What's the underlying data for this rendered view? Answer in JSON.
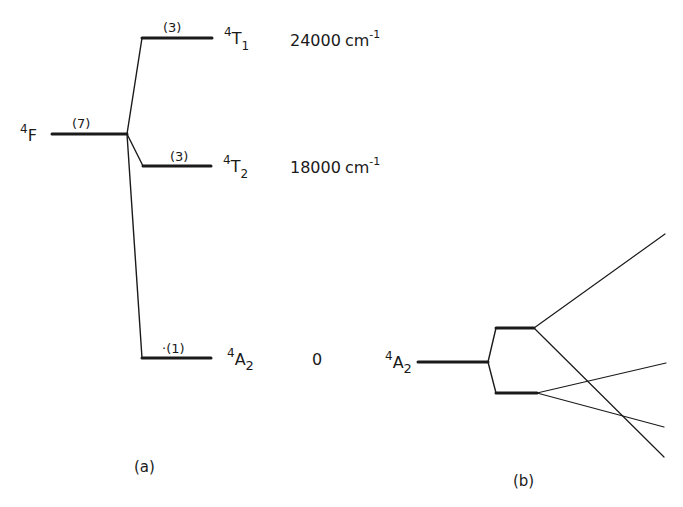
{
  "panel_a": {
    "caption": "(a)",
    "free_ion": {
      "sup": "4",
      "term": "F",
      "degeneracy": "(7)"
    },
    "levels": [
      {
        "sup": "4",
        "term": "T",
        "sub": "1",
        "degeneracy": "(3)",
        "energy": "24000",
        "unit": "cm",
        "unit_exp": "-1"
      },
      {
        "sup": "4",
        "term": "T",
        "sub": "2",
        "degeneracy": "(3)",
        "energy": "18000",
        "unit": "cm",
        "unit_exp": "-1"
      },
      {
        "sup": "4",
        "term": "A",
        "sub": "2",
        "degeneracy": "·(1)",
        "energy": "0"
      }
    ]
  },
  "panel_b": {
    "caption": "(b)",
    "level": {
      "sup": "4",
      "term": "A",
      "sub": "2"
    }
  },
  "colors": {
    "ink": "#1a1a1a",
    "background": "#ffffff"
  }
}
